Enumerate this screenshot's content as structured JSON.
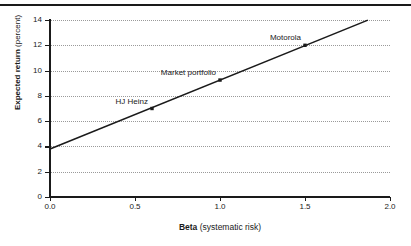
{
  "chart_data": {
    "type": "line",
    "title": "",
    "xlabel_bold": "Beta",
    "xlabel_rest": " (systematic risk)",
    "ylabel_bold": "Expected return",
    "ylabel_rest": " (percent)",
    "xlim": [
      0.0,
      2.0
    ],
    "ylim": [
      0,
      14
    ],
    "xticks": [
      "0.0",
      "0.5",
      "1.0",
      "1.5",
      "2.0"
    ],
    "xtick_values": [
      0.0,
      0.5,
      1.0,
      1.5,
      2.0
    ],
    "yticks": [
      "0",
      "2",
      "4",
      "6",
      "8",
      "10",
      "12",
      "14"
    ],
    "ytick_values": [
      0,
      2,
      4,
      6,
      8,
      10,
      12,
      14
    ],
    "grid": "horizontal-dotted",
    "legend": "none",
    "series": [
      {
        "name": "Security market line",
        "line": {
          "intercept": 3.8,
          "slope": 5.45
        },
        "x": [
          0.0,
          1.87
        ],
        "y": [
          3.8,
          13.99
        ]
      }
    ],
    "points": [
      {
        "label": "HJ Heinz",
        "x": 0.6,
        "y": 7.0,
        "label_anchor": "left"
      },
      {
        "label": "Market portfolio",
        "x": 1.0,
        "y": 9.25,
        "label_anchor": "left"
      },
      {
        "label": "Motorola",
        "x": 1.5,
        "y": 12.0,
        "label_anchor": "left"
      }
    ],
    "colors": {
      "line": "#1a1a1a",
      "grid": "#9a9a9a",
      "axis": "#1a1a1a",
      "text": "#1a1a1a",
      "background": "#ffffff"
    }
  }
}
